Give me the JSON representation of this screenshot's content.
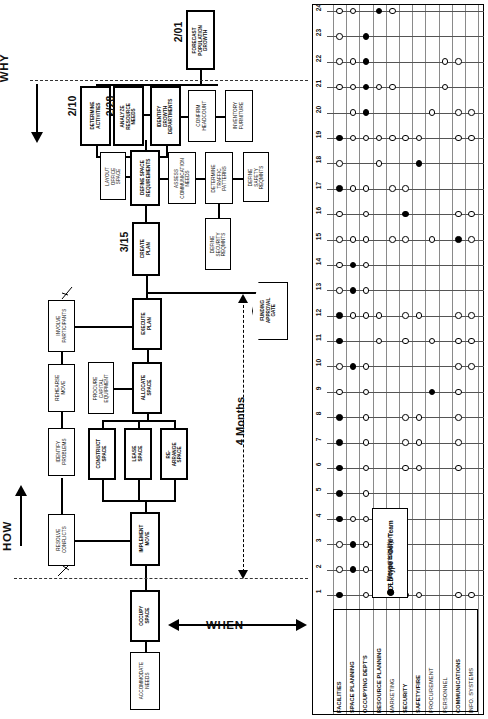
{
  "diagram": {
    "phases": [
      {
        "name": "why",
        "label": "WHY"
      },
      {
        "name": "how",
        "label": "HOW"
      },
      {
        "name": "when",
        "label": "WHEN"
      }
    ],
    "milestone_dates": [
      {
        "id": "d201",
        "label": "2/01"
      },
      {
        "id": "d210",
        "label": "2/10"
      },
      {
        "id": "d228",
        "label": "2/28"
      },
      {
        "id": "d315",
        "label": "3/15"
      }
    ],
    "duration_label": "4 Months",
    "gate": {
      "label": "FUNDING\nAPPROVAL\nGATE"
    },
    "tasks": [
      {
        "num": "0",
        "label": "OCCUPY\nSPACE",
        "core": true
      },
      {
        "num": "1",
        "label": "IMPLEMENT\nMOVE",
        "core": true
      },
      {
        "num": "2",
        "label": "RESOLVE\nCONFLICTS",
        "core": false
      },
      {
        "num": "3",
        "label": "IDENTIFY\nPROBLEMS",
        "core": false
      },
      {
        "num": "4",
        "label": "REHEARSE\nMOVE",
        "core": false
      },
      {
        "num": "5",
        "label": "INVOLVE\nPARTICIPANTS",
        "core": false
      },
      {
        "num": "6",
        "label": "CONSTRUCT\nSPACE",
        "core": true
      },
      {
        "num": "7",
        "label": "LEASE\nSPACE",
        "core": true
      },
      {
        "num": "8",
        "label": "RE-ARRANGE\nSPACE",
        "core": true
      },
      {
        "num": "9",
        "label": "PROCURE\nCAPITAL\nEQUIPMENT",
        "core": false
      },
      {
        "num": "10",
        "label": "ALLOCATE\nSPACE",
        "core": true
      },
      {
        "num": "11",
        "label": "EXECUTE\nPLAN",
        "core": true
      },
      {
        "num": "12",
        "label": "CREATE\nPLAN",
        "core": true
      },
      {
        "num": "13",
        "label": "LAYOUT\nOFFICE\nSPACE",
        "core": false
      },
      {
        "num": "14",
        "label": "DEFINE SPACE\nREQUIREMENTS",
        "core": true
      },
      {
        "num": "15",
        "label": "ASSESS\nCOMMUNICATION\nNEEDS",
        "core": false
      },
      {
        "num": "16",
        "label": "DEFINE\nSECURITY\nREQMNTS",
        "core": false
      },
      {
        "num": "17",
        "label": "DETERMINE\nTRAFFIC\nPATTERNS",
        "core": false
      },
      {
        "num": "18",
        "label": "DEFINE\nSAFETY\nREQMNTS",
        "core": false
      },
      {
        "num": "19",
        "label": "DETERMINE\nACTIVITIES",
        "core": true
      },
      {
        "num": "20",
        "label": "ANALYZE\nRESOURCE\nNEEDS",
        "core": true
      },
      {
        "num": "21",
        "label": "IDENTIFY\nGROWTH\nDEPARTMENTS",
        "core": true
      },
      {
        "num": "22",
        "label": "CONFIRM\nHEADCOUNT",
        "core": false
      },
      {
        "num": "23",
        "label": "INVENTORY\nFURNITURE",
        "core": false
      },
      {
        "num": "24",
        "label": "FORECAST\nPOPULATION\nGROWTH",
        "core": true
      },
      {
        "num": "",
        "label": "ACCOMMODATE\nNEEDS",
        "core": false
      }
    ]
  },
  "legend": {
    "title": "BOLD type = Core Team",
    "open_symbol_text": "= Moved to action",
    "filled_symbol_text": "= Responsibility"
  },
  "matrix": {
    "row_numbers": [
      "1",
      "2",
      "3",
      "4",
      "5",
      "6",
      "7",
      "8",
      "9",
      "10",
      "11",
      "12",
      "13",
      "14",
      "15",
      "16",
      "17",
      "18",
      "19",
      "20",
      "21",
      "22",
      "23",
      "24"
    ],
    "columns": [
      {
        "label": "FACILITIES",
        "bold": true
      },
      {
        "label": "SPACE PLANNING",
        "bold": true
      },
      {
        "label": "OCCUPYING DEPT'S",
        "bold": true
      },
      {
        "label": "RESOURCE PLANNING",
        "bold": true
      },
      {
        "label": "MARKETING",
        "bold": false
      },
      {
        "label": "SECURITY",
        "bold": true
      },
      {
        "label": "SAFETY/FIRE",
        "bold": true
      },
      {
        "label": "PROCUREMENT",
        "bold": false
      },
      {
        "label": "PERSONNEL",
        "bold": false
      },
      {
        "label": "COMMUNICATIONS",
        "bold": true
      },
      {
        "label": "INFO. SYSTEMS",
        "bold": false
      }
    ],
    "cells": [
      {
        "row": "1",
        "col": 0,
        "type": "filled"
      },
      {
        "row": "1",
        "col": 2,
        "type": "open"
      },
      {
        "row": "1",
        "col": 5,
        "type": "open"
      },
      {
        "row": "1",
        "col": 6,
        "type": "open"
      },
      {
        "row": "1",
        "col": 9,
        "type": "open"
      },
      {
        "row": "1",
        "col": 10,
        "type": "open"
      },
      {
        "row": "2",
        "col": 0,
        "type": "open"
      },
      {
        "row": "2",
        "col": 1,
        "type": "filled"
      },
      {
        "row": "2",
        "col": 2,
        "type": "open"
      },
      {
        "row": "3",
        "col": 0,
        "type": "open"
      },
      {
        "row": "3",
        "col": 1,
        "type": "filled"
      },
      {
        "row": "3",
        "col": 2,
        "type": "open"
      },
      {
        "row": "4",
        "col": 0,
        "type": "filled"
      },
      {
        "row": "4",
        "col": 1,
        "type": "open"
      },
      {
        "row": "4",
        "col": 2,
        "type": "open"
      },
      {
        "row": "5",
        "col": 0,
        "type": "filled"
      },
      {
        "row": "5",
        "col": 2,
        "type": "open"
      },
      {
        "row": "6",
        "col": 0,
        "type": "filled"
      },
      {
        "row": "6",
        "col": 2,
        "type": "open"
      },
      {
        "row": "6",
        "col": 5,
        "type": "open"
      },
      {
        "row": "6",
        "col": 6,
        "type": "open"
      },
      {
        "row": "6",
        "col": 9,
        "type": "open"
      },
      {
        "row": "7",
        "col": 0,
        "type": "filled"
      },
      {
        "row": "7",
        "col": 2,
        "type": "open"
      },
      {
        "row": "7",
        "col": 5,
        "type": "open"
      },
      {
        "row": "7",
        "col": 6,
        "type": "open"
      },
      {
        "row": "7",
        "col": 9,
        "type": "open"
      },
      {
        "row": "8",
        "col": 0,
        "type": "filled"
      },
      {
        "row": "8",
        "col": 2,
        "type": "open"
      },
      {
        "row": "8",
        "col": 5,
        "type": "open"
      },
      {
        "row": "8",
        "col": 6,
        "type": "open"
      },
      {
        "row": "8",
        "col": 9,
        "type": "open"
      },
      {
        "row": "9",
        "col": 0,
        "type": "open"
      },
      {
        "row": "9",
        "col": 2,
        "type": "open"
      },
      {
        "row": "9",
        "col": 7,
        "type": "filled"
      },
      {
        "row": "9",
        "col": 9,
        "type": "open"
      },
      {
        "row": "10",
        "col": 0,
        "type": "open"
      },
      {
        "row": "10",
        "col": 1,
        "type": "filled"
      },
      {
        "row": "10",
        "col": 2,
        "type": "open"
      },
      {
        "row": "10",
        "col": 9,
        "type": "open"
      },
      {
        "row": "10",
        "col": 10,
        "type": "open"
      },
      {
        "row": "11",
        "col": 0,
        "type": "filled"
      },
      {
        "row": "11",
        "col": 3,
        "type": "open"
      },
      {
        "row": "11",
        "col": 5,
        "type": "open"
      },
      {
        "row": "11",
        "col": 7,
        "type": "open"
      },
      {
        "row": "11",
        "col": 9,
        "type": "open"
      },
      {
        "row": "11",
        "col": 10,
        "type": "open"
      },
      {
        "row": "12",
        "col": 0,
        "type": "filled"
      },
      {
        "row": "12",
        "col": 1,
        "type": "open"
      },
      {
        "row": "12",
        "col": 2,
        "type": "open"
      },
      {
        "row": "12",
        "col": 3,
        "type": "open"
      },
      {
        "row": "12",
        "col": 5,
        "type": "open"
      },
      {
        "row": "12",
        "col": 6,
        "type": "open"
      },
      {
        "row": "12",
        "col": 9,
        "type": "open"
      },
      {
        "row": "12",
        "col": 10,
        "type": "open"
      },
      {
        "row": "13",
        "col": 0,
        "type": "open"
      },
      {
        "row": "13",
        "col": 1,
        "type": "filled"
      },
      {
        "row": "13",
        "col": 2,
        "type": "open"
      },
      {
        "row": "14",
        "col": 0,
        "type": "open"
      },
      {
        "row": "14",
        "col": 1,
        "type": "filled"
      },
      {
        "row": "14",
        "col": 2,
        "type": "open"
      },
      {
        "row": "15",
        "col": 0,
        "type": "open"
      },
      {
        "row": "15",
        "col": 1,
        "type": "open"
      },
      {
        "row": "15",
        "col": 2,
        "type": "open"
      },
      {
        "row": "15",
        "col": 4,
        "type": "open"
      },
      {
        "row": "15",
        "col": 5,
        "type": "open"
      },
      {
        "row": "15",
        "col": 7,
        "type": "open"
      },
      {
        "row": "15",
        "col": 9,
        "type": "filled"
      },
      {
        "row": "15",
        "col": 10,
        "type": "open"
      },
      {
        "row": "16",
        "col": 0,
        "type": "open"
      },
      {
        "row": "16",
        "col": 2,
        "type": "open"
      },
      {
        "row": "16",
        "col": 5,
        "type": "filled"
      },
      {
        "row": "16",
        "col": 9,
        "type": "open"
      },
      {
        "row": "16",
        "col": 10,
        "type": "open"
      },
      {
        "row": "17",
        "col": 0,
        "type": "filled"
      },
      {
        "row": "17",
        "col": 1,
        "type": "open"
      },
      {
        "row": "17",
        "col": 2,
        "type": "open"
      },
      {
        "row": "17",
        "col": 4,
        "type": "open"
      },
      {
        "row": "17",
        "col": 5,
        "type": "open"
      },
      {
        "row": "18",
        "col": 0,
        "type": "open"
      },
      {
        "row": "18",
        "col": 3,
        "type": "open"
      },
      {
        "row": "18",
        "col": 6,
        "type": "filled"
      },
      {
        "row": "19",
        "col": 0,
        "type": "filled"
      },
      {
        "row": "19",
        "col": 1,
        "type": "open"
      },
      {
        "row": "19",
        "col": 2,
        "type": "open"
      },
      {
        "row": "19",
        "col": 3,
        "type": "open"
      },
      {
        "row": "19",
        "col": 4,
        "type": "open"
      },
      {
        "row": "19",
        "col": 5,
        "type": "open"
      },
      {
        "row": "19",
        "col": 6,
        "type": "open"
      },
      {
        "row": "19",
        "col": 9,
        "type": "open"
      },
      {
        "row": "19",
        "col": 10,
        "type": "open"
      },
      {
        "row": "20",
        "col": 1,
        "type": "open"
      },
      {
        "row": "20",
        "col": 2,
        "type": "filled"
      },
      {
        "row": "20",
        "col": 7,
        "type": "open"
      },
      {
        "row": "20",
        "col": 9,
        "type": "open"
      },
      {
        "row": "20",
        "col": 10,
        "type": "open"
      },
      {
        "row": "21",
        "col": 0,
        "type": "open"
      },
      {
        "row": "21",
        "col": 1,
        "type": "open"
      },
      {
        "row": "21",
        "col": 2,
        "type": "filled"
      },
      {
        "row": "21",
        "col": 3,
        "type": "open"
      },
      {
        "row": "21",
        "col": 4,
        "type": "open"
      },
      {
        "row": "21",
        "col": 8,
        "type": "open"
      },
      {
        "row": "22",
        "col": 0,
        "type": "open"
      },
      {
        "row": "22",
        "col": 1,
        "type": "open"
      },
      {
        "row": "22",
        "col": 2,
        "type": "filled"
      },
      {
        "row": "22",
        "col": 8,
        "type": "open"
      },
      {
        "row": "22",
        "col": 9,
        "type": "open"
      },
      {
        "row": "23",
        "col": 0,
        "type": "open"
      },
      {
        "row": "23",
        "col": 2,
        "type": "filled"
      },
      {
        "row": "24",
        "col": 0,
        "type": "open"
      },
      {
        "row": "24",
        "col": 1,
        "type": "open"
      },
      {
        "row": "24",
        "col": 3,
        "type": "filled"
      },
      {
        "row": "24",
        "col": 4,
        "type": "open"
      }
    ]
  }
}
